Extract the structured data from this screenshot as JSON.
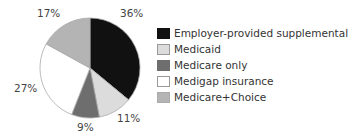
{
  "chart_data": {
    "type": "pie",
    "title": "",
    "categories": [
      "Employer-provided supplemental",
      "Medicaid",
      "Medicare only",
      "Medigap insurance",
      "Medicare+Choice"
    ],
    "values": [
      36,
      11,
      9,
      27,
      17
    ],
    "unit": "%",
    "colors": [
      "#111111",
      "#dcdcdc",
      "#6e6e6e",
      "#ffffff",
      "#b4b4b4"
    ],
    "value_labels": [
      "36%",
      "11%",
      "9%",
      "27%",
      "17%"
    ],
    "legend_position": "right",
    "start_angle": "12 o'clock, clockwise"
  },
  "legend": {
    "items": [
      {
        "label": "Employer-provided supplemental",
        "color": "#111111"
      },
      {
        "label": "Medicaid",
        "color": "#dcdcdc"
      },
      {
        "label": "Medicare only",
        "color": "#6e6e6e"
      },
      {
        "label": "Medigap insurance",
        "color": "#ffffff"
      },
      {
        "label": "Medicare+Choice",
        "color": "#b4b4b4"
      }
    ]
  }
}
